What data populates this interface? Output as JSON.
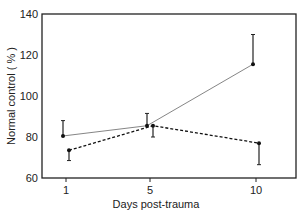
{
  "chart_data": {
    "type": "line",
    "title": "",
    "xlabel": "Days post-trauma",
    "ylabel": "Normal control ( % )",
    "ylim": [
      60,
      140
    ],
    "yticks": [
      60,
      80,
      100,
      120,
      140
    ],
    "xticks": [
      1,
      5,
      10
    ],
    "x": [
      1,
      5,
      10
    ],
    "grid": false,
    "series": [
      {
        "name": "solid",
        "style": "solid",
        "values": [
          80.5,
          85.5,
          115.5
        ],
        "error_upper": [
          88,
          91.5,
          130
        ]
      },
      {
        "name": "dashed",
        "style": "dashed",
        "values": [
          73.5,
          85.5,
          77
        ],
        "error_lower": [
          68.5,
          80,
          66.5
        ]
      }
    ]
  }
}
